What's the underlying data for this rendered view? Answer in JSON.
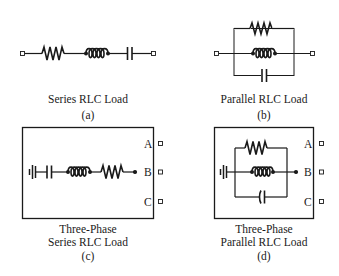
{
  "blocks": [
    {
      "id": "a",
      "caption_lines": [
        "Series RLC Load"
      ],
      "tag": "(a)",
      "type": "series-rlc",
      "components": [
        "resistor",
        "inductor",
        "capacitor"
      ],
      "ports": [
        "left-terminal",
        "right-terminal"
      ]
    },
    {
      "id": "b",
      "caption_lines": [
        "Parallel RLC Load"
      ],
      "tag": "(b)",
      "type": "parallel-rlc",
      "components": [
        "resistor",
        "inductor",
        "capacitor"
      ],
      "ports": [
        "left-terminal",
        "right-terminal"
      ]
    },
    {
      "id": "c",
      "caption_lines": [
        "Three-Phase",
        "Series RLC Load"
      ],
      "tag": "(c)",
      "type": "three-phase-series-rlc",
      "components": [
        "ground",
        "capacitor",
        "inductor",
        "resistor"
      ],
      "ports": [
        "A",
        "B",
        "C"
      ]
    },
    {
      "id": "d",
      "caption_lines": [
        "Three-Phase",
        "Parallel RLC Load"
      ],
      "tag": "(d)",
      "type": "three-phase-parallel-rlc",
      "components": [
        "ground",
        "resistor",
        "inductor",
        "capacitor"
      ],
      "ports": [
        "A",
        "B",
        "C"
      ]
    }
  ],
  "colors": {
    "stroke": "#1a1a1a",
    "background": "#ffffff"
  }
}
